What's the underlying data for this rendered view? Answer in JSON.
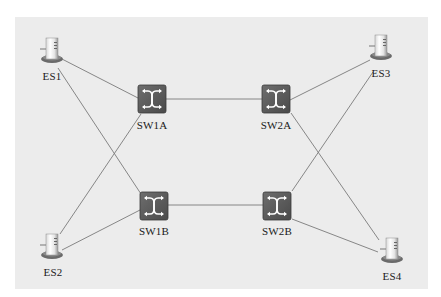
{
  "diagram": {
    "title": "",
    "colors": {
      "background": "#ffffff",
      "panel": "#ececec",
      "link": "#7a7a7a",
      "switch_fill": "#5c5c5c",
      "switch_arrows": "#ffffff"
    },
    "nodes": [
      {
        "id": "ES1",
        "type": "end-station",
        "label": "ES1",
        "x": 52,
        "y": 50
      },
      {
        "id": "ES2",
        "type": "end-station",
        "label": "ES2",
        "x": 52,
        "y": 246
      },
      {
        "id": "ES3",
        "type": "end-station",
        "label": "ES3",
        "x": 381,
        "y": 47
      },
      {
        "id": "ES4",
        "type": "end-station",
        "label": "ES4",
        "x": 392,
        "y": 250
      },
      {
        "id": "SW1A",
        "type": "switch",
        "label": "SW1A",
        "x": 152,
        "y": 99
      },
      {
        "id": "SW2A",
        "type": "switch",
        "label": "SW2A",
        "x": 276,
        "y": 99
      },
      {
        "id": "SW1B",
        "type": "switch",
        "label": "SW1B",
        "x": 154,
        "y": 206
      },
      {
        "id": "SW2B",
        "type": "switch",
        "label": "SW2B",
        "x": 277,
        "y": 206
      }
    ],
    "links": [
      {
        "from": "ES1",
        "to": "SW1A"
      },
      {
        "from": "ES1",
        "to": "SW1B"
      },
      {
        "from": "ES2",
        "to": "SW1A"
      },
      {
        "from": "ES2",
        "to": "SW1B"
      },
      {
        "from": "SW1A",
        "to": "SW2A"
      },
      {
        "from": "SW1B",
        "to": "SW2B"
      },
      {
        "from": "SW2A",
        "to": "ES3"
      },
      {
        "from": "SW2A",
        "to": "ES4"
      },
      {
        "from": "SW2B",
        "to": "ES3"
      },
      {
        "from": "SW2B",
        "to": "ES4"
      }
    ]
  },
  "labels": {
    "es1": "ES1",
    "es2": "ES2",
    "es3": "ES3",
    "es4": "ES4",
    "sw1a": "SW1A",
    "sw2a": "SW2A",
    "sw1b": "SW1B",
    "sw2b": "SW2B"
  }
}
